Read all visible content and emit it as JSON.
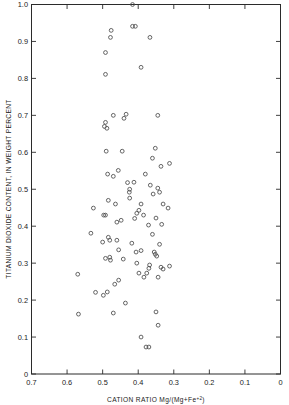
{
  "chart_data": {
    "type": "scatter",
    "title": "",
    "xlabel": "CATION RATIO Mg/(Mg+Fe+2)",
    "xlabel_main": "CATION  RATIO  Mg/(Mg+Fe",
    "xlabel_sup": "+2",
    "xlabel_tail": ")",
    "ylabel": "TITANIUM DIOXIDE CONTENT, IN WEIGHT PERCENT",
    "xlim": [
      0.7,
      0.0
    ],
    "ylim": [
      0.0,
      1.0
    ],
    "x_reversed": true,
    "grid": false,
    "legend": null,
    "marker": "open-circle",
    "marker_color": "#4a4a4a",
    "xticks": [
      0.7,
      0.6,
      0.5,
      0.4,
      0.3,
      0.2,
      0.1,
      0.0
    ],
    "xtick_labels": [
      "0.7",
      "0.6",
      "0.5",
      "0.4",
      "0.3",
      "0.2",
      "0.1",
      "0"
    ],
    "yticks": [
      0.0,
      0.1,
      0.2,
      0.3,
      0.4,
      0.5,
      0.6,
      0.7,
      0.8,
      0.9,
      1.0
    ],
    "ytick_labels": [
      "0",
      "0.1",
      "0.2",
      "0.3",
      "0.4",
      "0.5",
      "0.6",
      "0.7",
      "0.8",
      "0.9",
      "1.0"
    ],
    "n_points": 93,
    "points": [
      [
        0.416,
        1.0
      ],
      [
        0.476,
        0.93
      ],
      [
        0.416,
        0.941
      ],
      [
        0.408,
        0.941
      ],
      [
        0.478,
        0.911
      ],
      [
        0.367,
        0.911
      ],
      [
        0.492,
        0.87
      ],
      [
        0.392,
        0.83
      ],
      [
        0.492,
        0.811
      ],
      [
        0.47,
        0.7
      ],
      [
        0.434,
        0.703
      ],
      [
        0.44,
        0.692
      ],
      [
        0.492,
        0.681
      ],
      [
        0.495,
        0.67
      ],
      [
        0.345,
        0.7
      ],
      [
        0.49,
        0.603
      ],
      [
        0.445,
        0.603
      ],
      [
        0.352,
        0.611
      ],
      [
        0.36,
        0.584
      ],
      [
        0.336,
        0.562
      ],
      [
        0.312,
        0.57
      ],
      [
        0.486,
        0.541
      ],
      [
        0.456,
        0.551
      ],
      [
        0.47,
        0.535
      ],
      [
        0.38,
        0.541
      ],
      [
        0.412,
        0.519
      ],
      [
        0.424,
        0.5
      ],
      [
        0.425,
        0.492
      ],
      [
        0.345,
        0.503
      ],
      [
        0.34,
        0.492
      ],
      [
        0.484,
        0.47
      ],
      [
        0.464,
        0.46
      ],
      [
        0.392,
        0.46
      ],
      [
        0.33,
        0.46
      ],
      [
        0.316,
        0.449
      ],
      [
        0.526,
        0.449
      ],
      [
        0.398,
        0.443
      ],
      [
        0.404,
        0.435
      ],
      [
        0.385,
        0.43
      ],
      [
        0.497,
        0.43
      ],
      [
        0.492,
        0.43
      ],
      [
        0.35,
        0.422
      ],
      [
        0.371,
        0.403
      ],
      [
        0.533,
        0.381
      ],
      [
        0.484,
        0.37
      ],
      [
        0.48,
        0.362
      ],
      [
        0.46,
        0.362
      ],
      [
        0.34,
        0.351
      ],
      [
        0.355,
        0.33
      ],
      [
        0.352,
        0.324
      ],
      [
        0.348,
        0.319
      ],
      [
        0.48,
        0.316
      ],
      [
        0.478,
        0.308
      ],
      [
        0.442,
        0.311
      ],
      [
        0.312,
        0.292
      ],
      [
        0.404,
        0.3
      ],
      [
        0.336,
        0.289
      ],
      [
        0.33,
        0.284
      ],
      [
        0.368,
        0.295
      ],
      [
        0.376,
        0.273
      ],
      [
        0.344,
        0.262
      ],
      [
        0.455,
        0.254
      ],
      [
        0.57,
        0.27
      ],
      [
        0.436,
        0.192
      ],
      [
        0.35,
        0.168
      ],
      [
        0.47,
        0.165
      ],
      [
        0.568,
        0.162
      ],
      [
        0.344,
        0.132
      ],
      [
        0.392,
        0.1
      ],
      [
        0.378,
        0.073
      ],
      [
        0.37,
        0.073
      ],
      [
        0.488,
        0.665
      ],
      [
        0.43,
        0.518
      ],
      [
        0.424,
        0.476
      ],
      [
        0.366,
        0.511
      ],
      [
        0.358,
        0.487
      ],
      [
        0.492,
        0.313
      ],
      [
        0.398,
        0.273
      ],
      [
        0.384,
        0.262
      ],
      [
        0.37,
        0.286
      ],
      [
        0.392,
        0.334
      ],
      [
        0.406,
        0.33
      ],
      [
        0.487,
        0.222
      ],
      [
        0.498,
        0.213
      ],
      [
        0.52,
        0.221
      ],
      [
        0.41,
        0.421
      ],
      [
        0.448,
        0.416
      ],
      [
        0.46,
        0.411
      ],
      [
        0.334,
        0.405
      ],
      [
        0.36,
        0.378
      ],
      [
        0.455,
        0.336
      ],
      [
        0.418,
        0.354
      ],
      [
        0.5,
        0.357
      ],
      [
        0.466,
        0.243
      ]
    ]
  }
}
